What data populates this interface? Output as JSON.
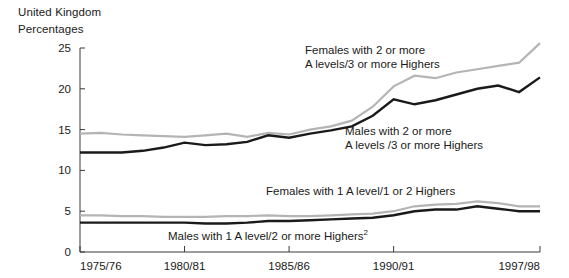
{
  "header": {
    "region": "United Kingdom",
    "units": "Percentages"
  },
  "chart_data": {
    "type": "line",
    "title": "United Kingdom",
    "subtitle": "Percentages",
    "xlabel": "",
    "ylabel": "Percentages",
    "ylim": [
      0,
      25
    ],
    "yticks": [
      0,
      5,
      10,
      15,
      20,
      25
    ],
    "ytick_labels": [
      "0",
      "5",
      "10",
      "15",
      "20",
      "25"
    ],
    "grid": false,
    "legend": "annotations-inline",
    "x": [
      "1975/76",
      "1976/77",
      "1977/78",
      "1978/79",
      "1979/80",
      "1980/81",
      "1981/82",
      "1982/83",
      "1983/84",
      "1984/85",
      "1985/86",
      "1986/87",
      "1987/88",
      "1988/89",
      "1989/90",
      "1990/91",
      "1991/92",
      "1992/93",
      "1993/94",
      "1994/95",
      "1995/96",
      "1996/97",
      "1997/98"
    ],
    "xtick_labels": [
      "1975/76",
      "1980/81",
      "1985/86",
      "1990/91",
      "1997/98"
    ],
    "xtick_indices": [
      0,
      5,
      10,
      15,
      22
    ],
    "series": [
      {
        "name": "Females with 2 or more A levels/3 or more Highers",
        "color": "#b4b4b4",
        "values": [
          14.5,
          14.6,
          14.4,
          14.3,
          14.2,
          14.1,
          14.3,
          14.5,
          14.1,
          14.6,
          14.4,
          15.0,
          15.4,
          16.1,
          17.8,
          20.3,
          21.6,
          21.3,
          22.0,
          22.4,
          22.8,
          23.2,
          25.6
        ]
      },
      {
        "name": "Males with 2 or more A levels /3 or more Highers",
        "color": "#1a1a1a",
        "values": [
          12.2,
          12.2,
          12.2,
          12.4,
          12.8,
          13.4,
          13.1,
          13.2,
          13.5,
          14.3,
          14.0,
          14.5,
          14.9,
          15.4,
          16.7,
          18.7,
          18.1,
          18.6,
          19.3,
          20.0,
          20.4,
          19.6,
          21.4
        ]
      },
      {
        "name": "Females with 1 A level/1 or 2 Highers",
        "color": "#b4b4b4",
        "values": [
          4.5,
          4.5,
          4.4,
          4.4,
          4.3,
          4.3,
          4.3,
          4.4,
          4.4,
          4.5,
          4.4,
          4.4,
          4.5,
          4.6,
          4.7,
          5.0,
          5.6,
          5.8,
          5.9,
          6.2,
          6.0,
          5.6,
          5.6
        ]
      },
      {
        "name": "Males with 1 A level/2 or more Highers",
        "color": "#1a1a1a",
        "values": [
          3.6,
          3.6,
          3.6,
          3.6,
          3.6,
          3.6,
          3.5,
          3.5,
          3.6,
          3.8,
          3.8,
          3.9,
          4.0,
          4.1,
          4.2,
          4.5,
          5.0,
          5.2,
          5.2,
          5.6,
          5.3,
          5.0,
          5.0
        ]
      }
    ],
    "annotations": [
      {
        "id": "females-two-or-more",
        "line1": "Females with 2 or more",
        "line2": "A levels/3 or more Highers"
      },
      {
        "id": "males-two-or-more",
        "line1": "Males with 2 or more",
        "line2": "A levels /3 or more Highers"
      },
      {
        "id": "females-one-a-level",
        "line1": "Females with 1 A level/1 or 2 Highers"
      },
      {
        "id": "males-one-a-level",
        "line1": "Males with 1 A level/2 or more Highers",
        "footnote": "2"
      }
    ]
  }
}
